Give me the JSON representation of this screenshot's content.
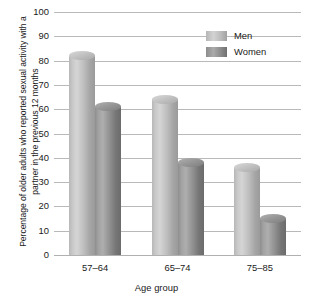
{
  "chart_data": {
    "type": "bar",
    "title": "",
    "subtitle": "",
    "xlabel": "Age group",
    "ylabel": "Percentage of older adults who reported sexual activity with a partner in the previous 12 months",
    "categories": [
      "57–64",
      "65–74",
      "75–85"
    ],
    "series": [
      {
        "name": "Men",
        "values": [
          82,
          64,
          36
        ],
        "color": "#c4c4c4"
      },
      {
        "name": "Women",
        "values": [
          61,
          38,
          15
        ],
        "color": "#8f8f8f"
      }
    ],
    "ylim": [
      0,
      100
    ],
    "ytick_step": 10,
    "yticks": [
      "100",
      "90",
      "80",
      "70",
      "60",
      "50",
      "40",
      "30",
      "20",
      "10",
      "0"
    ],
    "grid": true,
    "grid_axis": "y",
    "legend_position": "top-right",
    "bar_style": "cylinder"
  },
  "legend": {
    "items": [
      {
        "label": "Men"
      },
      {
        "label": "Women"
      }
    ]
  },
  "axes": {
    "y_title": "Percentage of older adults who reported sexual activity with a partner in the previous 12 months",
    "x_title": "Age group"
  }
}
